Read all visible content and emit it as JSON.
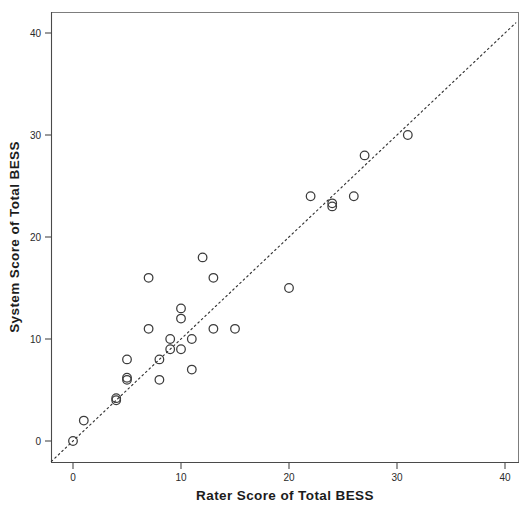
{
  "figure": {
    "background_color": "#ffffff",
    "marker_color": "#3c3c3c",
    "reference_line_color": "#333333",
    "axis_color": "#4a4a4a"
  },
  "chart_data": {
    "type": "scatter",
    "title": "",
    "xlabel": "Rater Score of Total BESS",
    "ylabel": "System Score of Total BESS",
    "xlim": [
      -2,
      41
    ],
    "ylim": [
      -2,
      42
    ],
    "xticks": [
      0,
      10,
      20,
      30,
      40
    ],
    "yticks": [
      0,
      10,
      20,
      30,
      40
    ],
    "xtick_labels": [
      "0",
      "10",
      "20",
      "30",
      "40"
    ],
    "ytick_labels": [
      "0",
      "10",
      "20",
      "30",
      "40"
    ],
    "grid": false,
    "legend": null,
    "marker": "open-circle",
    "reference_line": {
      "type": "identity",
      "style": "dotted",
      "x": [
        -2,
        41
      ],
      "y": [
        -2,
        41
      ]
    },
    "points": [
      {
        "x": 0,
        "y": 0
      },
      {
        "x": 1,
        "y": 2
      },
      {
        "x": 4,
        "y": 4
      },
      {
        "x": 4,
        "y": 4.2
      },
      {
        "x": 5,
        "y": 6
      },
      {
        "x": 5,
        "y": 6.2
      },
      {
        "x": 5,
        "y": 8
      },
      {
        "x": 7,
        "y": 11
      },
      {
        "x": 7,
        "y": 16
      },
      {
        "x": 8,
        "y": 6
      },
      {
        "x": 8,
        "y": 8
      },
      {
        "x": 9,
        "y": 9
      },
      {
        "x": 9,
        "y": 10
      },
      {
        "x": 10,
        "y": 9
      },
      {
        "x": 10,
        "y": 12
      },
      {
        "x": 10,
        "y": 13
      },
      {
        "x": 11,
        "y": 7
      },
      {
        "x": 11,
        "y": 10
      },
      {
        "x": 12,
        "y": 18
      },
      {
        "x": 13,
        "y": 11
      },
      {
        "x": 13,
        "y": 16
      },
      {
        "x": 15,
        "y": 11
      },
      {
        "x": 20,
        "y": 15
      },
      {
        "x": 22,
        "y": 24
      },
      {
        "x": 24,
        "y": 23
      },
      {
        "x": 24,
        "y": 23.3
      },
      {
        "x": 26,
        "y": 24
      },
      {
        "x": 27,
        "y": 28
      },
      {
        "x": 31,
        "y": 30
      }
    ]
  }
}
